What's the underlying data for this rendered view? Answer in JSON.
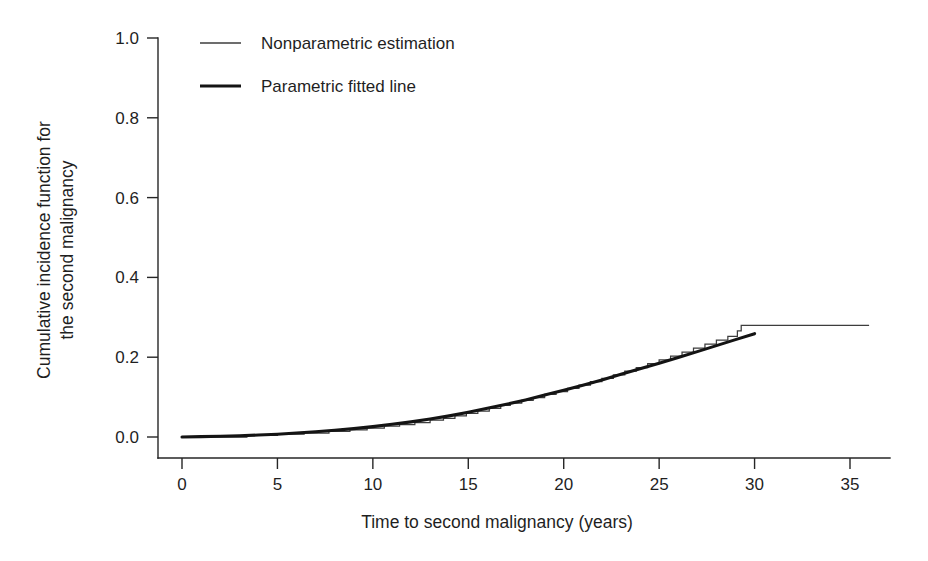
{
  "chart_data": {
    "type": "line",
    "title": "",
    "xlabel": "Time to second malignancy (years)",
    "ylabel": "Cumulative incidence function for the second malignancy",
    "ylabel_lines": [
      "Cumulative incidence function for",
      "the second malignancy"
    ],
    "xlim": [
      0,
      38
    ],
    "ylim": [
      0.0,
      1.0
    ],
    "grid": false,
    "legend_position": "top-left-inside",
    "xticks": [
      0,
      5,
      10,
      15,
      20,
      25,
      30,
      35
    ],
    "xtick_labels": [
      "0",
      "5",
      "10",
      "15",
      "20",
      "25",
      "30",
      "35"
    ],
    "yticks": [
      0.0,
      0.2,
      0.4,
      0.6,
      0.8,
      1.0
    ],
    "ytick_labels": [
      "0.0",
      "0.2",
      "0.4",
      "0.6",
      "0.8",
      "1.0"
    ],
    "series": [
      {
        "name": "Nonparametric estimation",
        "style": "step",
        "linewidth": "thin",
        "color": "#3d3d3d",
        "x": [
          0.0,
          3.2,
          3.4,
          4.6,
          5.0,
          6.2,
          6.4,
          7.5,
          7.7,
          8.6,
          8.8,
          9.5,
          9.7,
          10.4,
          10.6,
          11.2,
          11.4,
          12.0,
          12.2,
          12.8,
          13.0,
          13.5,
          13.7,
          14.1,
          14.3,
          14.7,
          14.9,
          15.3,
          15.5,
          15.9,
          16.1,
          16.5,
          16.7,
          17.0,
          17.2,
          17.6,
          17.8,
          18.2,
          18.4,
          18.8,
          19.0,
          19.4,
          19.6,
          20.0,
          20.2,
          20.6,
          20.8,
          21.2,
          21.4,
          21.8,
          22.0,
          22.4,
          22.6,
          23.0,
          23.2,
          23.6,
          23.8,
          24.2,
          24.4,
          24.8,
          25.0,
          25.4,
          25.6,
          26.0,
          26.2,
          26.6,
          26.8,
          27.2,
          27.4,
          27.8,
          28.0,
          28.4,
          28.6,
          28.9,
          29.1,
          29.3,
          36.0
        ],
        "y": [
          0.0,
          0.0,
          0.004,
          0.004,
          0.007,
          0.007,
          0.01,
          0.01,
          0.014,
          0.014,
          0.018,
          0.018,
          0.022,
          0.022,
          0.027,
          0.027,
          0.031,
          0.031,
          0.036,
          0.036,
          0.042,
          0.042,
          0.047,
          0.047,
          0.053,
          0.053,
          0.059,
          0.059,
          0.065,
          0.065,
          0.072,
          0.072,
          0.079,
          0.079,
          0.085,
          0.085,
          0.092,
          0.092,
          0.099,
          0.099,
          0.107,
          0.107,
          0.114,
          0.114,
          0.122,
          0.122,
          0.13,
          0.13,
          0.139,
          0.139,
          0.147,
          0.147,
          0.156,
          0.156,
          0.165,
          0.165,
          0.174,
          0.174,
          0.184,
          0.184,
          0.193,
          0.193,
          0.203,
          0.203,
          0.213,
          0.213,
          0.223,
          0.223,
          0.233,
          0.233,
          0.243,
          0.243,
          0.252,
          0.252,
          0.266,
          0.28,
          0.28
        ]
      },
      {
        "name": "Parametric fitted line",
        "style": "smooth",
        "linewidth": "thick",
        "color": "#141414",
        "x": [
          0.0,
          1.0,
          2.0,
          3.0,
          4.0,
          5.0,
          6.0,
          7.0,
          8.0,
          9.0,
          10.0,
          11.0,
          12.0,
          13.0,
          14.0,
          15.0,
          16.0,
          17.0,
          18.0,
          19.0,
          20.0,
          21.0,
          22.0,
          23.0,
          24.0,
          25.0,
          26.0,
          27.0,
          28.0,
          29.0,
          30.0
        ],
        "y": [
          0.0,
          0.001,
          0.002,
          0.003,
          0.005,
          0.007,
          0.01,
          0.013,
          0.017,
          0.021,
          0.026,
          0.032,
          0.038,
          0.045,
          0.053,
          0.062,
          0.072,
          0.082,
          0.093,
          0.105,
          0.117,
          0.13,
          0.143,
          0.157,
          0.171,
          0.185,
          0.199,
          0.214,
          0.229,
          0.244,
          0.259
        ]
      }
    ]
  },
  "legend": {
    "items": [
      {
        "label": "Nonparametric estimation"
      },
      {
        "label": "Parametric fitted line"
      }
    ]
  }
}
